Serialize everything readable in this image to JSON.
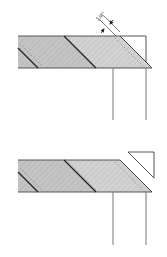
{
  "diagram": {
    "colors": {
      "fabric_dark": "#b9b9b9",
      "fabric_light": "#cfcfcf",
      "outline": "#555555",
      "seam": "#222222",
      "stitch": "#777777",
      "background": "#ffffff"
    },
    "top_figure": {
      "name": "strip with 1/4 inch seam allowance marked",
      "dimension_label": "1/4\""
    },
    "bottom_figure": {
      "name": "strip with corner triangle trimmed off"
    }
  }
}
